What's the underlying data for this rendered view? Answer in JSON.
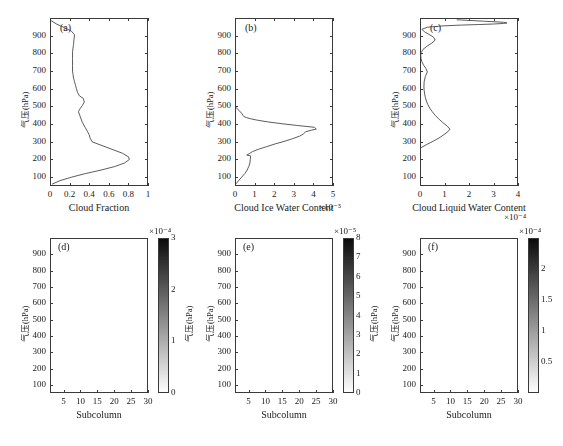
{
  "figure": {
    "width": 563,
    "height": 446,
    "background": "#ffffff",
    "axis_color": "#3a3a3a",
    "line_color": "#4a4a4a"
  },
  "labels": {
    "y_axis": "气压(hPa)",
    "subcolumn": "Subcolumn",
    "cloud_fraction": "Cloud Fraction",
    "cloud_ice_water_content": "Cloud Ice Water Content",
    "cloud_liquid_water_content": "Cloud Liquid Water Content",
    "exp_m5": "×10⁻⁵",
    "exp_m4": "×10⁻⁴"
  },
  "pressure_ticks": [
    "100",
    "200",
    "300",
    "400",
    "500",
    "600",
    "700",
    "800",
    "900"
  ],
  "subcolumn_ticks": [
    "5",
    "10",
    "15",
    "20",
    "25",
    "30"
  ],
  "chart_data": [
    {
      "id": "a",
      "tag": "(a)",
      "type": "line",
      "title": "",
      "xlabel": "Cloud Fraction",
      "ylabel": "气压(hPa)",
      "xlim": [
        0,
        1
      ],
      "ylim": [
        1000,
        50
      ],
      "xticks": [
        0,
        0.2,
        0.4,
        0.6,
        0.8,
        1
      ],
      "xticklabels": [
        "0",
        "0.2",
        "0.4",
        "0.6",
        "0.8",
        "1"
      ],
      "yticks": [
        100,
        200,
        300,
        400,
        500,
        600,
        700,
        800,
        900
      ],
      "grid": false,
      "multiplier": "",
      "x": [
        0.02,
        0.1,
        0.22,
        0.36,
        0.52,
        0.66,
        0.76,
        0.81,
        0.8,
        0.74,
        0.62,
        0.5,
        0.43,
        0.41,
        0.4,
        0.38,
        0.36,
        0.33,
        0.31,
        0.29,
        0.31,
        0.33,
        0.35,
        0.34,
        0.3,
        0.28,
        0.27,
        0.26,
        0.25,
        0.24,
        0.235,
        0.23,
        0.23,
        0.23,
        0.23,
        0.24,
        0.245,
        0.25,
        0.22,
        0.15,
        0.07,
        0.01
      ],
      "y": [
        60,
        80,
        100,
        120,
        140,
        160,
        180,
        200,
        215,
        235,
        260,
        285,
        300,
        320,
        340,
        360,
        380,
        410,
        440,
        470,
        490,
        505,
        525,
        545,
        560,
        580,
        600,
        620,
        640,
        660,
        680,
        700,
        730,
        770,
        810,
        850,
        880,
        905,
        925,
        945,
        965,
        985
      ]
    },
    {
      "id": "b",
      "tag": "(b)",
      "type": "line",
      "title": "",
      "xlabel": "Cloud Ice Water Content",
      "ylabel": "气压(hPa)",
      "xlim": [
        0,
        5
      ],
      "ylim": [
        1000,
        50
      ],
      "xticks": [
        0,
        1,
        2,
        3,
        4,
        5
      ],
      "xticklabels": [
        "0",
        "1",
        "2",
        "3",
        "4",
        "5"
      ],
      "yticks": [
        100,
        200,
        300,
        400,
        500,
        600,
        700,
        800,
        900
      ],
      "grid": false,
      "multiplier": "×10⁻⁵",
      "x": [
        0.05,
        0.18,
        0.34,
        0.5,
        0.62,
        0.7,
        0.76,
        0.78,
        0.8,
        0.6,
        0.72,
        0.9,
        1.2,
        1.6,
        2.05,
        2.5,
        2.95,
        3.3,
        3.48,
        3.6,
        3.9,
        4.15,
        4.05,
        3.2,
        2.4,
        1.7,
        1.15,
        0.8,
        0.58,
        0.45,
        0.4,
        0.36,
        0.2,
        0.04
      ],
      "y": [
        62,
        80,
        100,
        120,
        140,
        160,
        180,
        200,
        220,
        225,
        232,
        245,
        258,
        272,
        288,
        302,
        318,
        332,
        344,
        356,
        366,
        372,
        382,
        392,
        402,
        412,
        422,
        430,
        437,
        443,
        450,
        458,
        478,
        495
      ]
    },
    {
      "id": "c",
      "tag": "(c)",
      "type": "line",
      "title": "",
      "xlabel": "Cloud Liquid Water Content",
      "ylabel": "气压(hPa)",
      "xlim": [
        0,
        4
      ],
      "ylim": [
        1000,
        50
      ],
      "xticks": [
        0,
        1,
        2,
        3,
        4
      ],
      "xticklabels": [
        "0",
        "1",
        "2",
        "3",
        "4"
      ],
      "yticks": [
        100,
        200,
        300,
        400,
        500,
        600,
        700,
        800,
        900
      ],
      "grid": false,
      "multiplier": "×10⁻⁴",
      "x": [
        0.02,
        0.28,
        0.56,
        0.82,
        1.02,
        1.16,
        1.22,
        1.1,
        0.92,
        0.76,
        0.62,
        0.5,
        0.4,
        0.32,
        0.26,
        0.22,
        0.19,
        0.17,
        0.16,
        0.17,
        0.22,
        0.3,
        0.24,
        0.14,
        0.07,
        0.04,
        0.03,
        0.05,
        0.12,
        0.28,
        0.48,
        0.62,
        0.55,
        0.36,
        0.18,
        0.08,
        0.3,
        0.9,
        1.7,
        2.4,
        3.0,
        3.4,
        3.55,
        3.4,
        2.6,
        1.5
      ],
      "y": [
        265,
        285,
        305,
        325,
        345,
        360,
        372,
        390,
        410,
        430,
        450,
        470,
        490,
        510,
        530,
        550,
        570,
        590,
        610,
        640,
        670,
        695,
        715,
        735,
        755,
        772,
        788,
        805,
        822,
        840,
        858,
        875,
        892,
        908,
        922,
        936,
        948,
        955,
        960,
        963,
        966,
        969,
        972,
        976,
        982,
        990
      ]
    },
    {
      "id": "d",
      "tag": "(d)",
      "type": "heatmap",
      "title": "",
      "xlabel": "Subcolumn",
      "ylabel": "气压(hPa)",
      "xlim": [
        1,
        30
      ],
      "ylim": [
        1000,
        50
      ],
      "xticks": [
        5,
        10,
        15,
        20,
        25,
        30
      ],
      "yticks": [
        100,
        200,
        300,
        400,
        500,
        600,
        700,
        800,
        900
      ],
      "colorbar": {
        "vmin": 0,
        "vmax": 3,
        "ticks": [
          0,
          1,
          2,
          3
        ],
        "ticklabels": [
          "0",
          "1",
          "2",
          "3"
        ],
        "multiplier": "×10⁻⁴",
        "label": "气压(hPa)",
        "colormap": "gray_reversed",
        "position": "right"
      },
      "n_subcolumns": 30,
      "seed": 7,
      "pattern": "cloud_fraction_subcolumns"
    },
    {
      "id": "e",
      "tag": "(e)",
      "type": "heatmap",
      "title": "",
      "xlabel": "Subcolumn",
      "ylabel": "气压(hPa)",
      "xlim": [
        1,
        30
      ],
      "ylim": [
        1000,
        50
      ],
      "xticks": [
        5,
        10,
        15,
        20,
        25,
        30
      ],
      "yticks": [
        100,
        200,
        300,
        400,
        500,
        600,
        700,
        800,
        900
      ],
      "colorbar": {
        "vmin": 0,
        "vmax": 8,
        "ticks": [
          0,
          1,
          2,
          3,
          4,
          5,
          6,
          7,
          8
        ],
        "ticklabels": [
          "0",
          "1",
          "2",
          "3",
          "4",
          "5",
          "6",
          "7",
          "8"
        ],
        "multiplier": "×10⁻⁵",
        "label": "气压(hPa)",
        "colormap": "gray_reversed",
        "position": "right"
      },
      "n_subcolumns": 30,
      "seed": 13,
      "pattern": "ice_water_subcolumns"
    },
    {
      "id": "f",
      "tag": "(f)",
      "type": "heatmap",
      "title": "",
      "xlabel": "Subcolumn",
      "ylabel": "气压(hPa)",
      "xlim": [
        1,
        30
      ],
      "ylim": [
        1000,
        50
      ],
      "xticks": [
        5,
        10,
        15,
        20,
        25,
        30
      ],
      "yticks": [
        100,
        200,
        300,
        400,
        500,
        600,
        700,
        800,
        900
      ],
      "colorbar": {
        "vmin": 0,
        "vmax": 2.5,
        "ticks": [
          0.5,
          1,
          1.5,
          2
        ],
        "ticklabels": [
          "0.5",
          "1",
          "1.5",
          "2"
        ],
        "multiplier": "×10⁻⁴",
        "label": "",
        "colormap": "gray_reversed",
        "position": "right"
      },
      "n_subcolumns": 30,
      "seed": 29,
      "pattern": "liquid_water_subcolumns"
    }
  ]
}
